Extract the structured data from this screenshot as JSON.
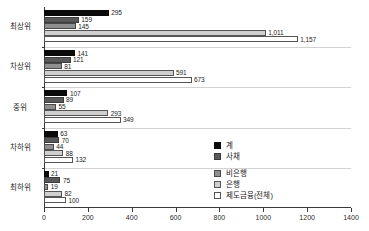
{
  "chart_data": {
    "type": "bar",
    "orientation": "horizontal",
    "title": "",
    "subtitle": "",
    "xlabel": "",
    "ylabel": "",
    "xlim": [
      0,
      1400
    ],
    "xticks": [
      0,
      200,
      400,
      600,
      800,
      1000,
      1200,
      1400
    ],
    "xtick_labels": [
      "0",
      "200",
      "400",
      "600",
      "800",
      "1000",
      "1200",
      "1400"
    ],
    "grid": false,
    "legend_position": "center-right",
    "categories": [
      "최상위",
      "차상위",
      "중위",
      "차하위",
      "최하위"
    ],
    "series": [
      {
        "name": "계",
        "color": "#0a0a0a",
        "values": [
          295,
          141,
          107,
          63,
          21
        ],
        "labels": [
          "295",
          "141",
          "107",
          "63",
          "21"
        ]
      },
      {
        "name": "사채",
        "color": "#585858",
        "values": [
          159,
          121,
          89,
          70,
          75
        ],
        "labels": [
          "159",
          "121",
          "89",
          "70",
          "75"
        ]
      },
      {
        "name": "비은행",
        "color": "#8f8f8f",
        "values": [
          145,
          81,
          55,
          44,
          19
        ],
        "labels": [
          "145",
          "81",
          "55",
          "44",
          "19"
        ]
      },
      {
        "name": "은행",
        "color": "#cfcfcf",
        "values": [
          1011,
          591,
          293,
          88,
          82
        ],
        "labels": [
          "1,011",
          "591",
          "293",
          "88",
          "82"
        ]
      },
      {
        "name": "제도금융(전체)",
        "color": "#ffffff",
        "values": [
          1157,
          673,
          349,
          132,
          100
        ],
        "labels": [
          "1,157",
          "673",
          "349",
          "132",
          "100"
        ]
      }
    ]
  },
  "legend": {
    "items": [
      {
        "label": "계",
        "swatch": "s0"
      },
      {
        "label": "사채",
        "swatch": "s1"
      },
      {
        "label": "비은행",
        "swatch": "s2"
      },
      {
        "label": "은행",
        "swatch": "s3"
      },
      {
        "label": "제도금융(전체)",
        "swatch": "s4"
      }
    ]
  }
}
